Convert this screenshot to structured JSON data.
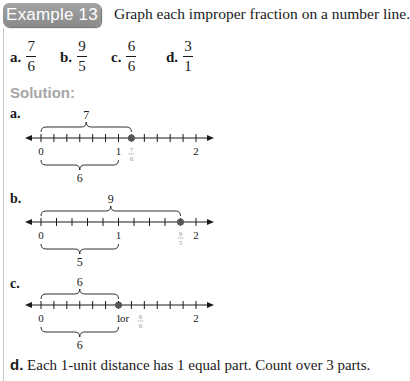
{
  "header": {
    "badge": "Example 13",
    "instruction": "Graph each improper fraction on a number line."
  },
  "problems": [
    {
      "label": "a.",
      "num": "7",
      "den": "6"
    },
    {
      "label": "b.",
      "num": "9",
      "den": "5"
    },
    {
      "label": "c.",
      "num": "6",
      "den": "6"
    },
    {
      "label": "d.",
      "num": "3",
      "den": "1"
    }
  ],
  "solution_heading": "Solution:",
  "number_lines": [
    {
      "label": "a.",
      "divisions_per_unit": 6,
      "point_num": 7,
      "point_den": 6,
      "point_label_num": "7",
      "point_label_den": "6",
      "point_label_prefix": "",
      "top_brace_count": "7",
      "bottom_brace_count": "6",
      "tick_labels": [
        "0",
        "1",
        "2"
      ]
    },
    {
      "label": "b.",
      "divisions_per_unit": 5,
      "point_num": 9,
      "point_den": 5,
      "point_label_num": "9",
      "point_label_den": "5",
      "point_label_prefix": "",
      "top_brace_count": "9",
      "bottom_brace_count": "5",
      "tick_labels": [
        "0",
        "1",
        "2"
      ]
    },
    {
      "label": "c.",
      "divisions_per_unit": 6,
      "point_num": 6,
      "point_den": 6,
      "point_label_num": "6",
      "point_label_den": "6",
      "point_label_prefix": "1 or",
      "top_brace_count": "6",
      "bottom_brace_count": "6",
      "tick_labels": [
        "0",
        "1",
        "2"
      ]
    }
  ],
  "part_d": {
    "label": "d.",
    "text": "Each 1-unit distance has 1 equal part. Count over 3 parts."
  },
  "colors": {
    "badge": "#999999",
    "solution_heading": "#a6a6a6",
    "point": "#555555",
    "point_label": "#9a9a9a",
    "ink": "#1a1a1a"
  }
}
